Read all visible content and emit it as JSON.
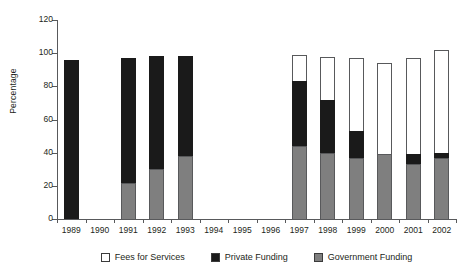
{
  "chart_data": {
    "type": "bar",
    "subtype": "stacked-vertical",
    "title": "",
    "xlabel": "",
    "ylabel": "Percentage",
    "ylim": [
      0,
      120
    ],
    "yticks": [
      0,
      20,
      40,
      60,
      80,
      100,
      120
    ],
    "grid": false,
    "legend_position": "bottom-center",
    "categories": [
      "1989",
      "1990",
      "1991",
      "1992",
      "1993",
      "1994",
      "1995",
      "1996",
      "1997",
      "1998",
      "1999",
      "2000",
      "2001",
      "2002"
    ],
    "series": [
      {
        "name": "Government Funding",
        "color": "#7f7f7f",
        "values": [
          0,
          null,
          22,
          30,
          38,
          null,
          null,
          null,
          44,
          40,
          37,
          39,
          33,
          37
        ]
      },
      {
        "name": "Private Funding",
        "color": "#1a1a1a",
        "values": [
          96,
          null,
          75,
          68,
          60,
          null,
          null,
          null,
          39,
          32,
          16,
          0,
          6,
          3
        ]
      },
      {
        "name": "Fees for Services",
        "color": "#ffffff",
        "values": [
          0,
          null,
          0,
          0,
          0,
          null,
          null,
          null,
          16,
          26,
          44,
          55,
          58,
          62
        ]
      }
    ],
    "totals": [
      96,
      null,
      97,
      98,
      98,
      null,
      null,
      null,
      99,
      98,
      97,
      94,
      97,
      102
    ],
    "legend": [
      "Fees for Services",
      "Private Funding",
      "Government Funding"
    ]
  }
}
